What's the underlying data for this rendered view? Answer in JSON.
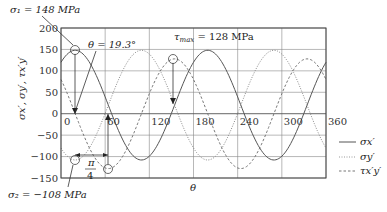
{
  "chart_data": {
    "type": "line",
    "title": "",
    "xlabel": "θ",
    "ylabel": "σx', σy', τx'y'",
    "xlim": [
      0,
      360
    ],
    "ylim": [
      -150,
      200
    ],
    "x_ticks": [
      0,
      60,
      120,
      180,
      240,
      300,
      360
    ],
    "y_ticks": [
      200,
      150,
      100,
      50,
      0,
      -50,
      -100,
      -150
    ],
    "grid": true,
    "legend_position": "right",
    "formula_params": {
      "mean": 20,
      "radius": 128,
      "theta_p_deg": 19.3
    },
    "series": [
      {
        "name": "σx'",
        "style": "solid",
        "color": "#555555",
        "x": [
          0,
          19.3,
          41.8,
          64.3,
          86.8,
          109.3,
          131.8,
          154.3,
          176.8,
          199.3,
          221.8,
          244.3,
          266.8,
          289.3,
          311.8,
          334.3,
          356.8,
          360
        ],
        "values": [
          120,
          148,
          111,
          20,
          -71,
          -108,
          -71,
          20,
          111,
          148,
          111,
          20,
          -71,
          -108,
          -71,
          20,
          111,
          120
        ]
      },
      {
        "name": "σy'",
        "style": "dotted",
        "color": "#888888",
        "x": [
          0,
          19.3,
          41.8,
          64.3,
          86.8,
          109.3,
          131.8,
          154.3,
          176.8,
          199.3,
          221.8,
          244.3,
          266.8,
          289.3,
          311.8,
          334.3,
          356.8,
          360
        ],
        "values": [
          -80,
          -108,
          -71,
          20,
          111,
          148,
          111,
          20,
          -71,
          -108,
          -71,
          20,
          111,
          148,
          111,
          20,
          -71,
          -80
        ]
      },
      {
        "name": "τx'y'",
        "style": "dashed",
        "color": "#777777",
        "x": [
          0,
          19.3,
          41.8,
          64.3,
          86.8,
          109.3,
          131.8,
          154.3,
          176.8,
          199.3,
          221.8,
          244.3,
          266.8,
          289.3,
          311.8,
          334.3,
          356.8,
          360
        ],
        "values": [
          80,
          0,
          -91,
          -128,
          -91,
          0,
          91,
          128,
          91,
          0,
          -91,
          -128,
          -91,
          0,
          91,
          128,
          91,
          80
        ]
      }
    ],
    "annotations": [
      {
        "text": "σ1 = 148 MPa",
        "x": 19.3,
        "y": 148
      },
      {
        "text": "θ = 19.3°",
        "x": 19.3,
        "y": 0
      },
      {
        "text": "τmax = 128 MPa",
        "x": 154.3,
        "y": 128
      },
      {
        "text": "σ2 = −108 MPa",
        "x": 19.3,
        "y": -108
      },
      {
        "text": "π/4",
        "x_range": [
          19.3,
          64.3
        ],
        "y": -100
      }
    ]
  },
  "labels": {
    "sigma1": "σ₁ = 148 MPa",
    "theta_p": "θ = 19.3°",
    "tau_max_sym": "τ",
    "tau_max_sub": "max",
    "tau_max_val": " = 128 MPa",
    "sigma2": "σ₂ = −108 MPa",
    "pi": "π",
    "four": "4",
    "xlabel": "θ",
    "ylabel": "σx′, σy′, τx′y′",
    "legend": [
      "σx′",
      "σy′",
      "τx′y′"
    ]
  }
}
